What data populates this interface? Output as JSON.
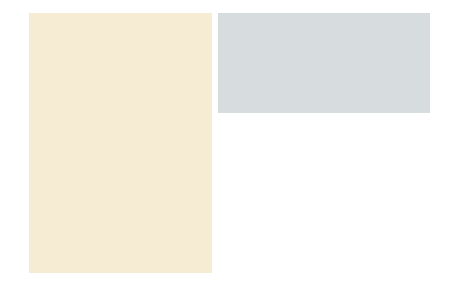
{
  "panel_a": {
    "title": "Diverging",
    "input_label": "Input",
    "output_label": "Output",
    "sublabel": "(a)",
    "background": "#f5ecd3"
  },
  "panel_b": {
    "title": "Converging",
    "input_label": "Input",
    "output_label": "Output",
    "sublabel": "(b)",
    "background": "#d7dcde"
  },
  "colors": {
    "neuron_fill": "#dfb98f",
    "neuron_stroke": "#b48a66",
    "nucleus": "#8a3b25",
    "axon": "#9b7a62",
    "arrow": "#222222"
  }
}
